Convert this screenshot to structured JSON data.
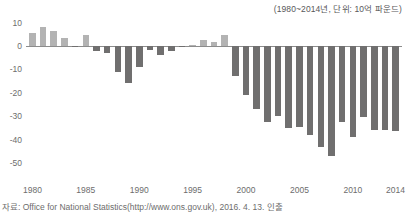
{
  "unit_note": "(1980~2014년, 단위: 10억 파운드)",
  "source": "자료: Office for National Statistics(http://www.ons.gov.uk), 2016. 4. 13. 인출",
  "colors": {
    "positive_bar": "#b3b3b3",
    "negative_bar": "#706f6f",
    "axis": "#8c8c8c",
    "text": "#6d6d6d"
  },
  "chart_data": {
    "type": "bar",
    "title": "",
    "subtitle": "",
    "xlabel": "",
    "ylabel": "",
    "unit": "10억 파운드",
    "grid": false,
    "legend": "none",
    "ylim": [
      -50,
      10
    ],
    "yticks": [
      10,
      0,
      -10,
      -20,
      -30,
      -40,
      -50
    ],
    "ytick_labels": [
      "10",
      "0",
      "-10",
      "-20",
      "-30",
      "-40",
      "-50"
    ],
    "xticks": [
      1980,
      1985,
      1990,
      1995,
      2000,
      2005,
      2010,
      2014
    ],
    "xtick_labels": [
      "1980",
      "1985",
      "1990",
      "1995",
      "2000",
      "2005",
      "2010",
      "2014"
    ],
    "xlim": [
      1979.4,
      2014.6
    ],
    "categories": [
      1980,
      1981,
      1982,
      1983,
      1984,
      1985,
      1986,
      1987,
      1988,
      1989,
      1990,
      1991,
      1992,
      1993,
      1994,
      1995,
      1996,
      1997,
      1998,
      1999,
      2000,
      2001,
      2002,
      2003,
      2004,
      2005,
      2006,
      2007,
      2008,
      2009,
      2010,
      2011,
      2012,
      2013,
      2014
    ],
    "values": [
      5.6,
      8.0,
      6.6,
      3.4,
      -0.2,
      4.7,
      -2.1,
      -3.2,
      -11.2,
      -15.6,
      -9.0,
      -1.8,
      -3.9,
      -2.0,
      -0.4,
      0.5,
      2.4,
      1.7,
      4.5,
      -13.0,
      -21.0,
      -27.0,
      -32.5,
      -30.0,
      -35.0,
      -34.5,
      -38.0,
      -43.0,
      -47.0,
      -32.5,
      -39.0,
      -30.5,
      -36.0,
      -36.0,
      -36.5
    ]
  }
}
